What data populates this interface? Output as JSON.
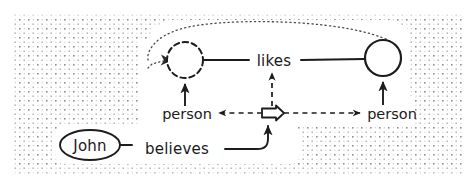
{
  "figure": {
    "kind": "hand-drawn-conceptual-graph",
    "title_text": "",
    "background": {
      "texture": "stipple-dots",
      "dot_color": "#9a9a9a",
      "page_color": "#ffffff",
      "margin_px": 14
    },
    "stroke_color": "#1c1c1c",
    "text_color": "#1a1a1a"
  },
  "nodes": {
    "john_concept": {
      "label": "John",
      "shape": "ellipse",
      "stroke": "solid",
      "cx": 90,
      "cy": 145,
      "rx": 30,
      "ry": 15
    },
    "left_referent_circle": {
      "label": "",
      "shape": "circle",
      "stroke": "dashed",
      "cx": 185,
      "cy": 60,
      "r": 18
    },
    "right_referent_circle": {
      "label": "",
      "shape": "circle",
      "stroke": "solid",
      "cx": 383,
      "cy": 58,
      "r": 18
    },
    "proposition_marker": {
      "label": "",
      "shape": "block-arrow-right",
      "stroke": "solid",
      "cx": 272,
      "cy": 113
    }
  },
  "relations": {
    "likes": {
      "label": "likes",
      "x": 274,
      "y": 61
    },
    "believes": {
      "label": "believes",
      "x": 175,
      "y": 149
    },
    "person_left": {
      "label": "person",
      "x": 190,
      "y": 115
    },
    "person_right": {
      "label": "person",
      "x": 392,
      "y": 114
    }
  },
  "edges": [
    {
      "name": "likes-to-left-circle",
      "style": "solid",
      "arrow": "none"
    },
    {
      "name": "likes-to-right-circle",
      "style": "solid",
      "arrow": "none"
    },
    {
      "name": "person-left-to-left-circle",
      "style": "solid",
      "arrow": "up"
    },
    {
      "name": "person-right-to-right-circle",
      "style": "solid",
      "arrow": "up"
    },
    {
      "name": "proposition-to-person-left",
      "style": "dashed",
      "arrow": "left"
    },
    {
      "name": "proposition-to-person-right",
      "style": "dashed",
      "arrow": "right"
    },
    {
      "name": "proposition-to-likes",
      "style": "dashed",
      "arrow": "up"
    },
    {
      "name": "believes-to-proposition",
      "style": "solid",
      "arrow": "up"
    },
    {
      "name": "john-to-believes",
      "style": "solid",
      "arrow": "none"
    },
    {
      "name": "coreference-arc",
      "style": "dotted",
      "arrow": "left"
    }
  ]
}
